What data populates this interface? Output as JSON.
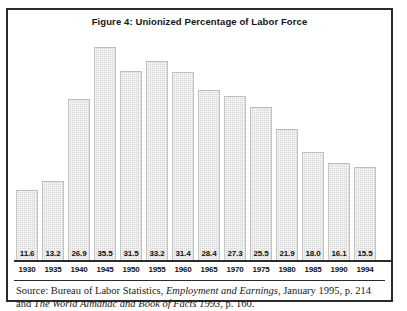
{
  "figure": {
    "title": "Figure 4: Unionized Percentage of Labor Force",
    "border_color": "#2b2b2b",
    "bar_fill_color": "#d8d8d8",
    "background_color": "#ffffff"
  },
  "source": {
    "prefix": "Source: Bureau of Labor Statistics, ",
    "italic_1": "Employment and Earnings",
    "middle": ", January 1995, p. 214 and ",
    "italic_2": "The World Almanac and Book of Facts 1993",
    "suffix": ", p. 160."
  },
  "chart_data": {
    "type": "bar",
    "title": "Figure 4: Unionized Percentage of Labor Force",
    "xlabel": "",
    "ylabel": "",
    "ylim": [
      0,
      38
    ],
    "grid": false,
    "legend": "none",
    "categories": [
      "1930",
      "1935",
      "1940",
      "1945",
      "1950",
      "1955",
      "1960",
      "1965",
      "1970",
      "1975",
      "1980",
      "1985",
      "1990",
      "1994"
    ],
    "values": [
      11.6,
      13.2,
      26.9,
      35.5,
      31.5,
      33.2,
      31.4,
      28.4,
      27.3,
      25.5,
      21.9,
      18.0,
      16.1,
      15.5
    ],
    "value_labels": [
      "11.6",
      "13.2",
      "26.9",
      "35.5",
      "31.5",
      "33.2",
      "31.4",
      "28.4",
      "27.3",
      "25.5",
      "21.9",
      "18.0",
      "16.1",
      "15.5"
    ]
  }
}
